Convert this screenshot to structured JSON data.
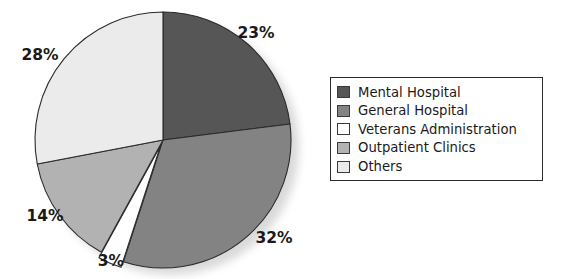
{
  "chart_data": {
    "type": "pie",
    "title": "",
    "categories": [
      "Mental Hospital",
      "General Hospital",
      "Veterans Administration",
      "Outpatient Clinics",
      "Others"
    ],
    "values": [
      23,
      32,
      3,
      14,
      28
    ],
    "value_labels": [
      "23%",
      "32%",
      "3%",
      "14%",
      "28%"
    ],
    "colors": [
      "#565656",
      "#838383",
      "#ffffff",
      "#b2b2b2",
      "#ebebeb"
    ],
    "legend_position": "right",
    "grid": false,
    "start_angle_deg": 0,
    "direction": "clockwise",
    "exploded_slices": [
      "Veterans Administration"
    ]
  },
  "pie": {
    "center_x": 163,
    "center_y": 140,
    "radius": 128,
    "slices": [
      {
        "label": "Mental Hospital",
        "percent": 23,
        "value_label": "23%",
        "color": "#565656",
        "label_x": 256,
        "label_y": 38
      },
      {
        "label": "General Hospital",
        "percent": 32,
        "value_label": "32%",
        "color": "#838383",
        "label_x": 274,
        "label_y": 243
      },
      {
        "label": "Veterans Administration",
        "percent": 3,
        "value_label": "3%",
        "color": "#ffffff",
        "label_x": 111,
        "label_y": 266
      },
      {
        "label": "Outpatient Clinics",
        "percent": 14,
        "value_label": "14%",
        "color": "#b2b2b2",
        "label_x": 45,
        "label_y": 221
      },
      {
        "label": "Others",
        "percent": 28,
        "value_label": "28%",
        "color": "#ebebeb",
        "label_x": 40,
        "label_y": 60
      }
    ]
  },
  "legend": {
    "items": [
      {
        "label": "Mental Hospital",
        "color": "#565656"
      },
      {
        "label": "General Hospital",
        "color": "#838383"
      },
      {
        "label": "Veterans Administration",
        "color": "#ffffff"
      },
      {
        "label": "Outpatient Clinics",
        "color": "#b2b2b2"
      },
      {
        "label": "Others",
        "color": "#ebebeb"
      }
    ]
  },
  "style": {
    "outline_color": "#2a2a2a",
    "shadow_color": "#d9d9d9",
    "text_color": "#1a1a1a",
    "background": "#ffffff"
  }
}
